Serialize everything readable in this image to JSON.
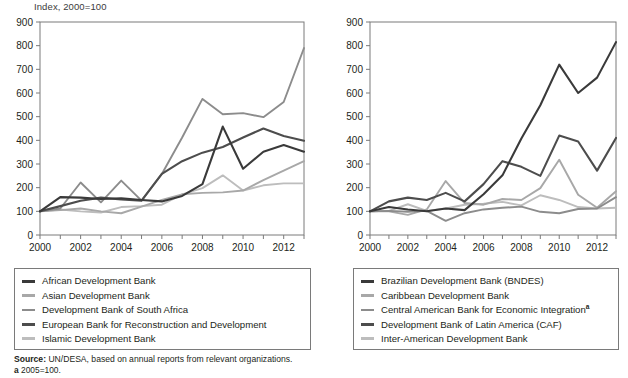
{
  "figure": {
    "axis_title": "Index, 2000=100",
    "source_prefix": "Source:",
    "source_text": "UN/DESA, based on annual reports from relevant organizations.",
    "footnote_mark": "a",
    "footnote_text": "2005=100."
  },
  "colors": {
    "axis": "#7a7a7a",
    "text": "#231f20",
    "series_dark": "#3a3a3a",
    "series_mid_dark": "#4d4d4d",
    "series_mid": "#8c8c8c",
    "series_light": "#a8a8a8",
    "series_lighter": "#bdbdbd"
  },
  "legend_left": {
    "items": [
      {
        "label": "African Development Bank",
        "color": "#3a3a3a",
        "weight": "dark"
      },
      {
        "label": "Asian Development Bank",
        "color": "#a8a8a8",
        "weight": "light"
      },
      {
        "label": "Development Bank of South Africa",
        "color": "#8c8c8c",
        "weight": "light"
      },
      {
        "label": "European Bank for Reconstruction and Development",
        "color": "#4d4d4d",
        "weight": "dark"
      },
      {
        "label": "Islamic Development Bank",
        "color": "#bdbdbd",
        "weight": "light"
      }
    ]
  },
  "legend_right": {
    "items": [
      {
        "label": "Brazilian Development Bank (BNDES)",
        "color": "#3a3a3a",
        "weight": "dark",
        "superscript": ""
      },
      {
        "label": "Caribbean Development Bank",
        "color": "#a8a8a8",
        "weight": "light",
        "superscript": ""
      },
      {
        "label": "Central American Bank for Economic Integration",
        "color": "#8c8c8c",
        "weight": "light",
        "superscript": "a"
      },
      {
        "label": "Development Bank of Latin America (CAF)",
        "color": "#4d4d4d",
        "weight": "dark",
        "superscript": ""
      },
      {
        "label": "Inter-American Development Bank",
        "color": "#bdbdbd",
        "weight": "light",
        "superscript": ""
      }
    ]
  },
  "chart_data": [
    {
      "type": "line",
      "title": "Index, 2000=100",
      "panel": "left",
      "xlabel": "",
      "ylabel": "",
      "x": [
        2000,
        2001,
        2002,
        2003,
        2004,
        2005,
        2006,
        2007,
        2008,
        2009,
        2010,
        2011,
        2012,
        2013
      ],
      "xlim": [
        2000,
        2013
      ],
      "ylim": [
        0,
        900
      ],
      "yticks": [
        0,
        100,
        200,
        300,
        400,
        500,
        600,
        700,
        800,
        900
      ],
      "xticks": [
        2000,
        2002,
        2004,
        2006,
        2008,
        2010,
        2012
      ],
      "grid": false,
      "legend_position": "below",
      "series": [
        {
          "name": "African Development Bank",
          "color": "#3a3a3a",
          "values": [
            100,
            160,
            158,
            152,
            155,
            148,
            142,
            165,
            215,
            458,
            280,
            352,
            380,
            352
          ]
        },
        {
          "name": "Asian Development Bank",
          "color": "#a8a8a8",
          "values": [
            100,
            105,
            112,
            100,
            92,
            120,
            148,
            172,
            178,
            180,
            188,
            232,
            272,
            312
          ]
        },
        {
          "name": "Development Bank of South Africa",
          "color": "#8c8c8c",
          "values": [
            100,
            112,
            222,
            138,
            230,
            145,
            258,
            412,
            575,
            510,
            515,
            498,
            562,
            790
          ]
        },
        {
          "name": "European Bank for Reconstruction and Development",
          "color": "#4d4d4d",
          "values": [
            100,
            122,
            145,
            158,
            150,
            145,
            258,
            312,
            348,
            372,
            412,
            450,
            418,
            398
          ]
        },
        {
          "name": "Islamic Development Bank",
          "color": "#bdbdbd",
          "values": [
            100,
            108,
            100,
            95,
            118,
            122,
            128,
            172,
            198,
            252,
            188,
            210,
            218,
            218
          ]
        }
      ]
    },
    {
      "type": "line",
      "title": "",
      "panel": "right",
      "xlabel": "",
      "ylabel": "",
      "x": [
        2000,
        2001,
        2002,
        2003,
        2004,
        2005,
        2006,
        2007,
        2008,
        2009,
        2010,
        2011,
        2012,
        2013
      ],
      "xlim": [
        2000,
        2013
      ],
      "ylim": [
        0,
        900
      ],
      "yticks": [
        0,
        100,
        200,
        300,
        400,
        500,
        600,
        700,
        800,
        900
      ],
      "xticks": [
        2000,
        2002,
        2004,
        2006,
        2008,
        2010,
        2012
      ],
      "grid": false,
      "legend_position": "below",
      "series": [
        {
          "name": "Brazilian Development Bank (BNDES)",
          "color": "#3a3a3a",
          "values": [
            100,
            118,
            108,
            100,
            112,
            105,
            172,
            252,
            408,
            548,
            720,
            600,
            665,
            815
          ]
        },
        {
          "name": "Caribbean Development Bank",
          "color": "#a8a8a8",
          "values": [
            100,
            100,
            85,
            108,
            228,
            135,
            128,
            152,
            148,
            198,
            318,
            170,
            115,
            185
          ]
        },
        {
          "name": "Central American Bank for Economic Integration",
          "color": "#8c8c8c",
          "values": [
            100,
            102,
            98,
            102,
            60,
            92,
            108,
            115,
            120,
            98,
            92,
            110,
            112,
            160
          ]
        },
        {
          "name": "Development Bank of Latin America (CAF)",
          "color": "#4d4d4d",
          "values": [
            100,
            142,
            158,
            148,
            178,
            142,
            215,
            312,
            288,
            250,
            420,
            395,
            272,
            410
          ]
        },
        {
          "name": "Inter-American Development Bank",
          "color": "#bdbdbd",
          "values": [
            100,
            102,
            130,
            102,
            112,
            128,
            132,
            140,
            125,
            168,
            148,
            118,
            112,
            115
          ]
        }
      ]
    }
  ]
}
